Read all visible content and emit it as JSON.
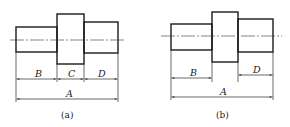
{
  "figures": [
    {
      "id": "a",
      "caption": "(a)",
      "dimensions": {
        "overall": "A",
        "left": "B",
        "middle": "C",
        "right": "D"
      }
    },
    {
      "id": "b",
      "caption": "(b)",
      "dimensions": {
        "overall": "A",
        "left": "B",
        "right": "D"
      }
    }
  ],
  "colors": {
    "line": "#1a1a1a",
    "background": "#ffffff"
  }
}
